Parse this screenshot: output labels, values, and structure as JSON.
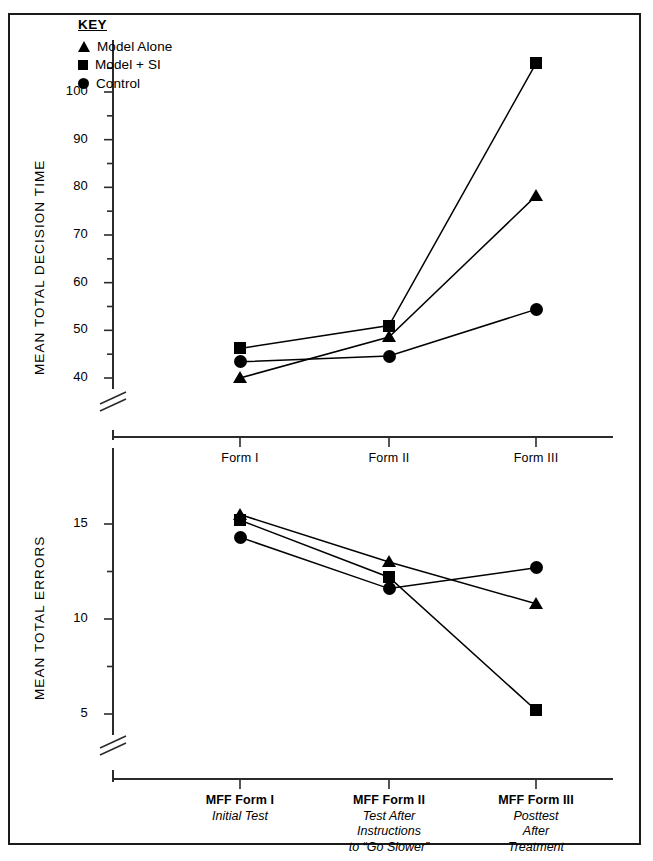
{
  "key": {
    "title": "KEY",
    "entries": [
      {
        "label": "Model Alone",
        "marker": "triangle-icon"
      },
      {
        "label": "Model + SI",
        "marker": "square-icon"
      },
      {
        "label": "Control",
        "marker": "circle-icon"
      }
    ]
  },
  "panels": {
    "top": {
      "ylabel": "MEAN TOTAL DECISION TIME",
      "yticks": [
        "40",
        "50",
        "60",
        "70",
        "80",
        "90",
        "100"
      ],
      "xticks": [
        "Form I",
        "Form II",
        "Form III"
      ]
    },
    "bottom": {
      "ylabel": "MEAN TOTAL ERRORS",
      "yticks": [
        "5",
        "10",
        "15"
      ],
      "xgroups": [
        {
          "head": "MFF Form I",
          "sub": [
            "Initial Test"
          ]
        },
        {
          "head": "MFF Form II",
          "sub": [
            "Test After",
            "Instructions",
            "to “Go Slower”"
          ]
        },
        {
          "head": "MFF Form III",
          "sub": [
            "Posttest",
            "After",
            "Treatment"
          ]
        }
      ]
    }
  },
  "colors": {
    "ink": "#000000",
    "frame": "#1a1a1a",
    "axis": "#2b2b2b"
  },
  "chart_data": [
    {
      "type": "line",
      "title": "",
      "panel": "top",
      "xlabel": "",
      "ylabel": "MEAN TOTAL DECISION TIME",
      "categories": [
        "Form I",
        "Form II",
        "Form III"
      ],
      "ylim": [
        37,
        110
      ],
      "yticks": [
        40,
        50,
        60,
        70,
        80,
        90,
        100
      ],
      "yminor": [
        45,
        55,
        65,
        75,
        85,
        95,
        105
      ],
      "axis_break": true,
      "grid": false,
      "legend": "inside-top-left",
      "series": [
        {
          "name": "Model Alone",
          "marker": "triangle",
          "values": [
            40.0,
            48.6,
            78.2
          ]
        },
        {
          "name": "Model + SI",
          "marker": "square",
          "values": [
            46.2,
            51.0,
            106.0
          ]
        },
        {
          "name": "Control",
          "marker": "circle",
          "values": [
            43.4,
            44.6,
            54.4
          ]
        }
      ]
    },
    {
      "type": "line",
      "title": "",
      "panel": "bottom",
      "xlabel": "",
      "ylabel": "MEAN TOTAL ERRORS",
      "categories": [
        "MFF Form I",
        "MFF Form II",
        "MFF Form III"
      ],
      "ylim": [
        3.5,
        17
      ],
      "yticks": [
        5,
        10,
        15
      ],
      "yminor": [
        7.5,
        12.5
      ],
      "axis_break": true,
      "grid": false,
      "series": [
        {
          "name": "Model Alone",
          "marker": "triangle",
          "values": [
            15.5,
            13.0,
            10.8
          ]
        },
        {
          "name": "Model + SI",
          "marker": "square",
          "values": [
            15.2,
            12.2,
            5.2
          ]
        },
        {
          "name": "Control",
          "marker": "circle",
          "values": [
            14.3,
            11.6,
            12.7
          ]
        }
      ]
    }
  ]
}
